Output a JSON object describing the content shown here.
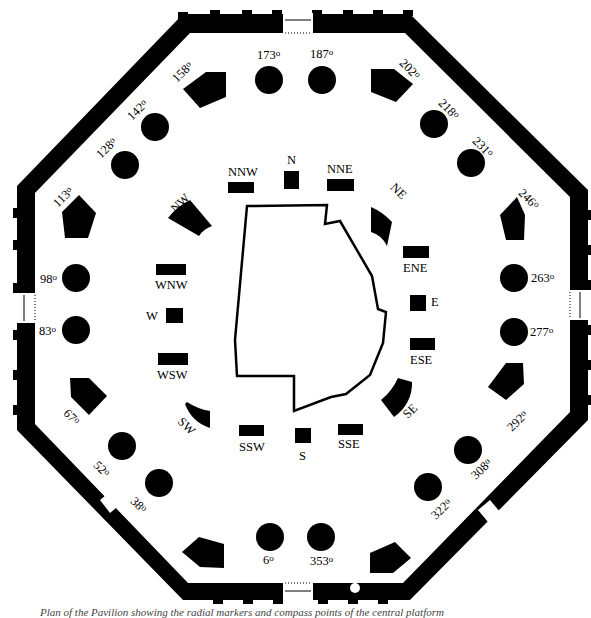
{
  "diagram": {
    "outer_markers": [
      {
        "label": "173",
        "unit": "o",
        "shape": "circle"
      },
      {
        "label": "187",
        "unit": "o",
        "shape": "circle"
      },
      {
        "label": "202",
        "unit": "o",
        "shape": "pentagon"
      },
      {
        "label": "218",
        "unit": "o",
        "shape": "circle"
      },
      {
        "label": "231",
        "unit": "o",
        "shape": "circle"
      },
      {
        "label": "246",
        "unit": "o",
        "shape": "pentagon"
      },
      {
        "label": "263",
        "unit": "o",
        "shape": "circle"
      },
      {
        "label": "277",
        "unit": "o",
        "shape": "circle"
      },
      {
        "label": "292",
        "unit": "o",
        "shape": "pentagon"
      },
      {
        "label": "308",
        "unit": "o",
        "shape": "circle"
      },
      {
        "label": "322",
        "unit": "o",
        "shape": "circle"
      },
      {
        "label": "338",
        "unit": "o",
        "shape": "pentagon"
      },
      {
        "label": "353",
        "unit": "o",
        "shape": "circle"
      },
      {
        "label": "6",
        "unit": "o",
        "shape": "circle"
      },
      {
        "label": "22",
        "unit": "o",
        "shape": "pentagon"
      },
      {
        "label": "38",
        "unit": "o",
        "shape": "circle"
      },
      {
        "label": "52",
        "unit": "o",
        "shape": "circle"
      },
      {
        "label": "67",
        "unit": "o",
        "shape": "pentagon"
      },
      {
        "label": "83",
        "unit": "o",
        "shape": "circle"
      },
      {
        "label": "98",
        "unit": "o",
        "shape": "circle"
      },
      {
        "label": "113",
        "unit": "o",
        "shape": "pentagon"
      },
      {
        "label": "128",
        "unit": "o",
        "shape": "circle"
      },
      {
        "label": "142",
        "unit": "o",
        "shape": "circle"
      },
      {
        "label": "158",
        "unit": "o",
        "shape": "pentagon"
      }
    ],
    "compass_points": [
      {
        "label": "N"
      },
      {
        "label": "NNE"
      },
      {
        "label": "NE"
      },
      {
        "label": "ENE"
      },
      {
        "label": "E"
      },
      {
        "label": "ESE"
      },
      {
        "label": "SE"
      },
      {
        "label": "SSE"
      },
      {
        "label": "S"
      },
      {
        "label": "SSW"
      },
      {
        "label": "SW"
      },
      {
        "label": "WSW"
      },
      {
        "label": "W"
      },
      {
        "label": "WNW"
      },
      {
        "label": "NW"
      },
      {
        "label": "NNW"
      }
    ],
    "caption": "Plan of the Pavilion showing the radial markers and compass points of the central platform"
  }
}
